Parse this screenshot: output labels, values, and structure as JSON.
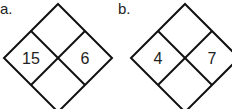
{
  "diagrams": [
    {
      "label": "a.",
      "left": "15",
      "right": "6",
      "top": "",
      "bottom": ""
    },
    {
      "label": "b.",
      "left": "4",
      "right": "7",
      "top": "",
      "bottom": ""
    }
  ]
}
